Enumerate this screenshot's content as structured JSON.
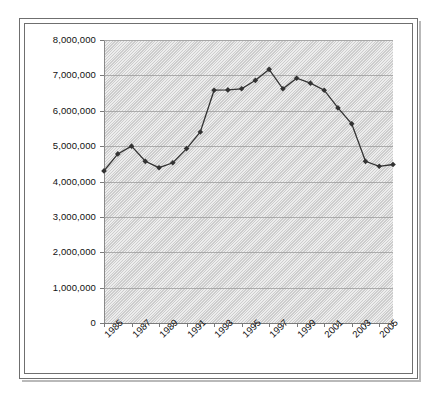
{
  "chart_data": {
    "type": "line",
    "title": "",
    "subtitle": "",
    "xlabel": "",
    "ylabel": "",
    "grid": true,
    "legend": false,
    "legend_position": "none",
    "xlim": [
      1985,
      2006
    ],
    "ylim": [
      0,
      8000000
    ],
    "x": [
      1985,
      1986,
      1987,
      1988,
      1989,
      1990,
      1991,
      1992,
      1993,
      1994,
      1995,
      1996,
      1997,
      1998,
      1999,
      2000,
      2001,
      2002,
      2003,
      2004,
      2005,
      2006
    ],
    "values": [
      4300000,
      4780000,
      5000000,
      4570000,
      4390000,
      4530000,
      4930000,
      5400000,
      6580000,
      6590000,
      6620000,
      6860000,
      7170000,
      6620000,
      6920000,
      6780000,
      6580000,
      6080000,
      5630000,
      4570000,
      4430000,
      4480000
    ],
    "categories": [
      "1985",
      "1986",
      "1987",
      "1988",
      "1989",
      "1990",
      "1991",
      "1992",
      "1993",
      "1994",
      "1995",
      "1996",
      "1997",
      "1998",
      "1999",
      "2000",
      "2001",
      "2002",
      "2003",
      "2004",
      "2005",
      "2006"
    ],
    "series": [
      {
        "name": "Series 1",
        "values": [
          4300000,
          4780000,
          5000000,
          4570000,
          4390000,
          4530000,
          4930000,
          5400000,
          6580000,
          6590000,
          6620000,
          6860000,
          7170000,
          6620000,
          6920000,
          6780000,
          6580000,
          6080000,
          5630000,
          4570000,
          4430000,
          4480000
        ],
        "color": "#333333",
        "marker": "diamond"
      }
    ],
    "y_tick_labels": [
      "8,000,000",
      "7,000,000",
      "6,000,000",
      "5,000,000",
      "4,000,000",
      "3,000,000",
      "2,000,000",
      "1,000,000",
      "0"
    ],
    "y_tick_values": [
      8000000,
      7000000,
      6000000,
      5000000,
      4000000,
      3000000,
      2000000,
      1000000,
      0
    ],
    "x_tick_labels": [
      "1985",
      "1987",
      "1989",
      "1991",
      "1993",
      "1995",
      "1997",
      "1999",
      "2001",
      "2003",
      "2005"
    ],
    "x_tick_values": [
      1985,
      1987,
      1989,
      1991,
      1993,
      1995,
      1997,
      1999,
      2001,
      2003,
      2005
    ],
    "plot_area_color": "#d6d6d6",
    "gridline_color": "#9a9a9a",
    "axis_color": "#7a7a7a",
    "text_color": "#111111",
    "frame_color": "#6f6f6f"
  }
}
